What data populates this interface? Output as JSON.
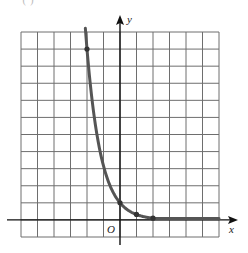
{
  "figure": {
    "panel_label": "( )"
  },
  "chart_data": {
    "type": "line",
    "title": "",
    "xlabel": "x",
    "ylabel": "y",
    "origin_label": "O",
    "xlim": [
      -6,
      6
    ],
    "ylim": [
      -1,
      11
    ],
    "grid": true,
    "grid_step": 1,
    "tick_labels_shown": false,
    "legend": null,
    "series": [
      {
        "name": "exponential decay curve",
        "function_estimate": "y = 10^(-x/2)",
        "color": "#555555",
        "marked_points": [
          {
            "x": -2,
            "y": 10
          },
          {
            "x": 0,
            "y": 1
          },
          {
            "x": 1,
            "y": 0.32
          },
          {
            "x": 2,
            "y": 0.1
          }
        ],
        "x_range": [
          -2.1,
          6
        ]
      }
    ]
  },
  "colors": {
    "grid": "#6e6e6e",
    "axis": "#111111",
    "curve": "#555555",
    "background": "#ffffff"
  }
}
